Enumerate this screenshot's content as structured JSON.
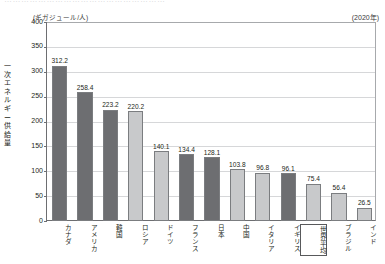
{
  "top_cut_text": "…………………………………………………",
  "unit_label": "(ギガジュール/人)",
  "year_label": "(2020年)",
  "y_axis_title": "一次エネルギー供給量",
  "colors": {
    "bar_dark": "#6d6e71",
    "bar_light": "#c8c9cb",
    "axis": "#6d6e71",
    "grid": "#d6d7d9",
    "text": "#231f20"
  },
  "chart_data": {
    "type": "bar",
    "title": "",
    "subtitle": "",
    "xlabel": "",
    "ylabel": "一次エネルギー供給量",
    "unit": "(ギガジュール/人)",
    "annotation": "(2020年)",
    "ylim": [
      0,
      400
    ],
    "yticks": [
      0,
      50,
      100,
      150,
      200,
      250,
      300,
      350,
      400
    ],
    "ytick_labels": [
      "0",
      "50",
      "100",
      "150",
      "200",
      "250",
      "300",
      "350",
      "400"
    ],
    "grid": true,
    "legend": false,
    "categories": [
      "カナダ",
      "アメリカ",
      "韓国",
      "ロシア",
      "ドイツ",
      "フランス",
      "日本",
      "中国",
      "イタリア",
      "イギリス",
      "世界平均",
      "ブラジル",
      "インド"
    ],
    "values": [
      312.2,
      258.4,
      223.2,
      220.2,
      140.1,
      134.4,
      128.1,
      103.8,
      96.8,
      96.1,
      75.4,
      56.4,
      26.5
    ],
    "value_labels": [
      "312.2",
      "258.4",
      "223.2",
      "220.2",
      "140.1",
      "134.4",
      "128.1",
      "103.8",
      "96.8",
      "96.1",
      "75.4",
      "56.4",
      "26.5"
    ],
    "bar_shades": [
      "dark",
      "dark",
      "dark",
      "light",
      "light",
      "dark",
      "dark",
      "light",
      "light",
      "dark",
      "light",
      "light",
      "light"
    ],
    "highlighted_category": "世界平均"
  }
}
